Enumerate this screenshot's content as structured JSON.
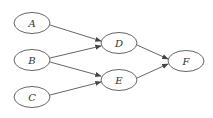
{
  "diagram": {
    "type": "directed-graph",
    "nodes": {
      "A": {
        "label": "A",
        "cx": 32,
        "cy": 23
      },
      "B": {
        "label": "B",
        "cx": 32,
        "cy": 60
      },
      "C": {
        "label": "C",
        "cx": 32,
        "cy": 97
      },
      "D": {
        "label": "D",
        "cx": 119,
        "cy": 43
      },
      "E": {
        "label": "E",
        "cx": 119,
        "cy": 80
      },
      "F": {
        "label": "F",
        "cx": 186,
        "cy": 61
      }
    },
    "edges": [
      {
        "from": "A",
        "to": "D"
      },
      {
        "from": "B",
        "to": "D"
      },
      {
        "from": "B",
        "to": "E"
      },
      {
        "from": "C",
        "to": "E"
      },
      {
        "from": "D",
        "to": "F"
      },
      {
        "from": "E",
        "to": "F"
      }
    ]
  }
}
